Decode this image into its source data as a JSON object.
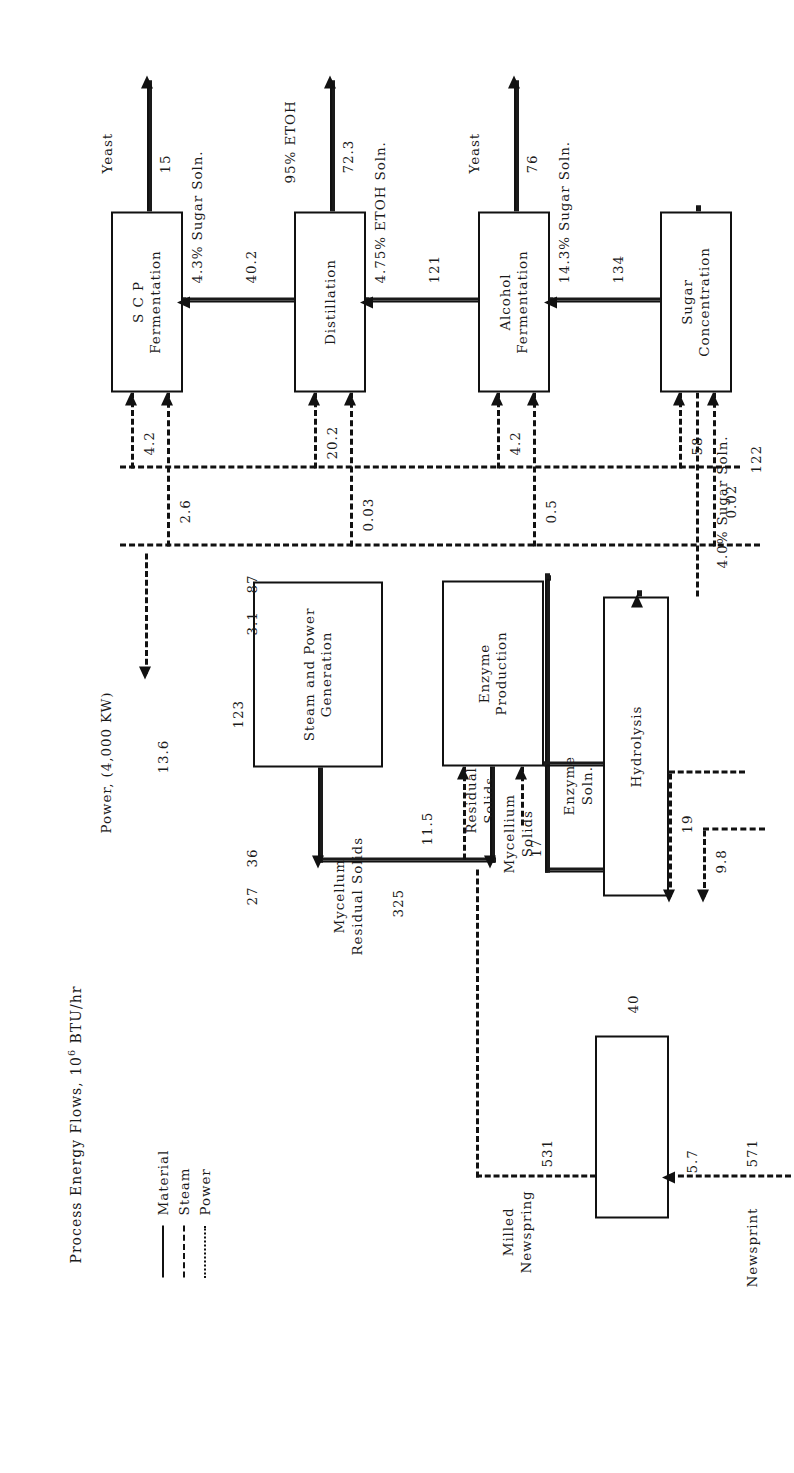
{
  "figure": {
    "caption_pre": "Process Energy Flows, 10",
    "caption_exp": "6",
    "caption_post": " BTU/hr"
  },
  "legend": {
    "items": [
      {
        "label": "Material",
        "style": "solid"
      },
      {
        "label": "Steam",
        "style": "dashed"
      },
      {
        "label": "Power",
        "style": "dotted"
      }
    ]
  },
  "blocks": {
    "milling": "",
    "hydrolysis": "Hydrolysis",
    "enzyme_production": "Enzyme\nProduction",
    "steam_power": "Steam and Power\nGeneration",
    "sugar_concentration": "Sugar\nConcentration",
    "alcohol_fermentation": "Alcohol\nFermentation",
    "distillation": "Distillation",
    "scp_fermentation": "S C P\nFermentation"
  },
  "streams": {
    "newsprint_name": "Newsprint",
    "newsprint_value": "571",
    "milled_name": "Milled\nNewspring",
    "milled_value": "531",
    "sugar40_name": "4.0% Sugar Soln.",
    "sugar40_value": "122",
    "sugar143_name": "14.3% Sugar Soln.",
    "sugar143_value": "134",
    "etoh475_name": "4.75% ETOH Soln.",
    "etoh475_value": "121",
    "sugar43_name": "4.3% Sugar Soln.",
    "sugar43_value": "40.2",
    "etoh95_name": "95% ETOH",
    "etoh95_value": "72.3",
    "yeast1_name": "Yeast",
    "yeast1_value": "76",
    "yeast2_name": "Yeast",
    "yeast2_value": "15",
    "enzyme_soln_name": "Enzyme\nSoln.",
    "residual_solids_name": "Residual\nSolids",
    "mycellium_solids_name": "Mycellium\nSolids",
    "mycellum_residual_name": "Mycellum\nResidual Solids",
    "mycellum_residual_value": "325",
    "power_out_name": "Power, (4,000 KW)",
    "power_out_value": "13.6"
  },
  "energy": {
    "milling_power": "5.7",
    "milling_steam": "40",
    "hydrolysis_power": "9.8",
    "hydrolysis_steam": "19",
    "enzyme_power": "11.5",
    "enzyme_steam_a": "17",
    "sugarconc_power": "0.02",
    "sugarconc_steam": "58",
    "alcohol_power": "0.5",
    "alcohol_steam": "4.2",
    "distillation_power": "0.03",
    "distillation_steam": "20.2",
    "scp_power": "2.6",
    "scp_steam": "4.2",
    "steam_out_123": "123",
    "steam_bus_87": "87",
    "power_bus_3_1": "3.1",
    "lower_steam_36": "36",
    "lower_power_27": "27"
  }
}
